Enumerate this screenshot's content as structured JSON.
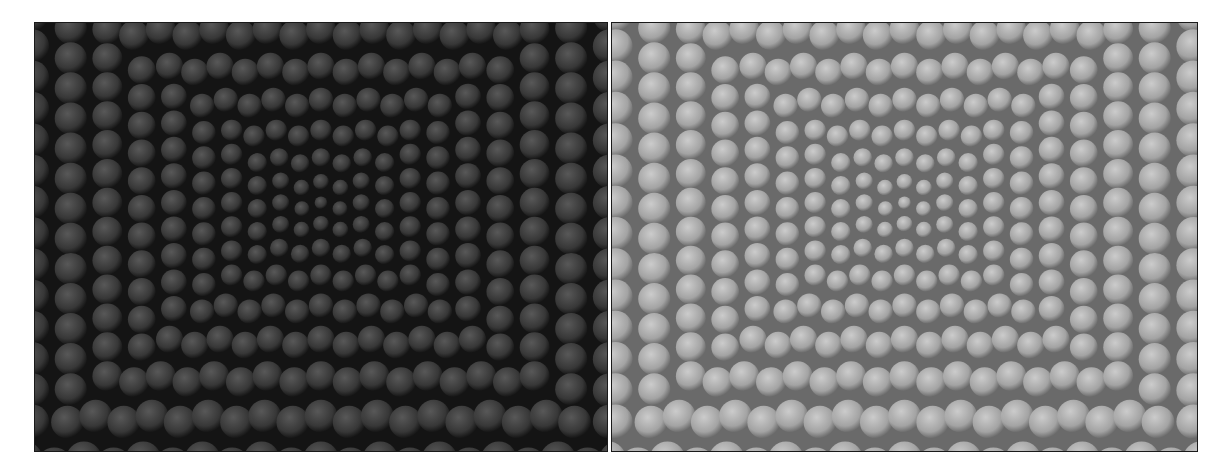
{
  "figure": {
    "panels": [
      {
        "id": "left",
        "description": "Dark, low-exposure rendering of a perspective grid of spheres receding toward a central vanishing point",
        "base_color": "#3a3a3a",
        "highlight_color": "#5e5e5e",
        "shadow_color": "#141414"
      },
      {
        "id": "right",
        "description": "Bright, enhanced rendering of the same perspective grid of spheres",
        "base_color": "#a8a8a8",
        "highlight_color": "#d4d4d4",
        "shadow_color": "#6a6a6a"
      }
    ]
  }
}
